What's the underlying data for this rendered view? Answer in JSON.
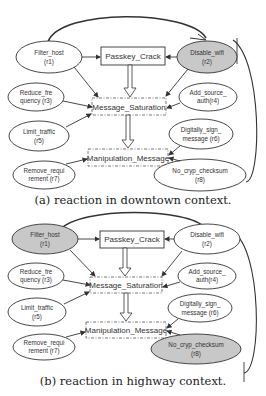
{
  "panels": [
    {
      "id": "a",
      "caption": "(a) reaction in downtown context.",
      "threats": {
        "passkey": "Passkey_Crack",
        "saturation": "Message_Saturation",
        "manipulation": "Manipulation_Message"
      },
      "reactions": [
        {
          "line1": "Filter_host",
          "line2": "(r1)",
          "highlighted": false
        },
        {
          "line1": "Disable_wifi",
          "line2": "(r2)",
          "highlighted": true
        },
        {
          "line1": "Reduce_fre",
          "line2": "quency (r3)",
          "highlighted": false
        },
        {
          "line1": "Add_source_",
          "line2": "auth(r4)",
          "highlighted": false
        },
        {
          "line1": "Limit_traffic",
          "line2": "(r5)",
          "highlighted": false
        },
        {
          "line1": "Digitally_sign_",
          "line2": "message (r6)",
          "highlighted": false
        },
        {
          "line1": "Remove_requi",
          "line2": "rement (r7)",
          "highlighted": false
        },
        {
          "line1": "No_cryp_checksum",
          "line2": "(r8)",
          "highlighted": false
        }
      ]
    },
    {
      "id": "b",
      "caption": "(b) reaction in highway context.",
      "threats": {
        "passkey": "Passkey_Crack",
        "saturation": "Message_Saturation",
        "manipulation": "Manipulation_Message"
      },
      "reactions": [
        {
          "line1": "Filter_host",
          "line2": "(r1)",
          "highlighted": true
        },
        {
          "line1": "Disable_wifi",
          "line2": "(r2)",
          "highlighted": false
        },
        {
          "line1": "Reduce_fre",
          "line2": "quency (r3)",
          "highlighted": false
        },
        {
          "line1": "Add_source_",
          "line2": "auth(r4)",
          "highlighted": false
        },
        {
          "line1": "Limit_traffic",
          "line2": "(r5)",
          "highlighted": false
        },
        {
          "line1": "Digitally_sign_",
          "line2": "message (r6)",
          "highlighted": false
        },
        {
          "line1": "Remove_requi",
          "line2": "rement (r7)",
          "highlighted": false
        },
        {
          "line1": "No_cryp_checksum",
          "line2": "(r8)",
          "highlighted": true
        }
      ]
    }
  ],
  "colors": {
    "highlight_fill": "#c8c8c8",
    "stroke": "#333333"
  }
}
